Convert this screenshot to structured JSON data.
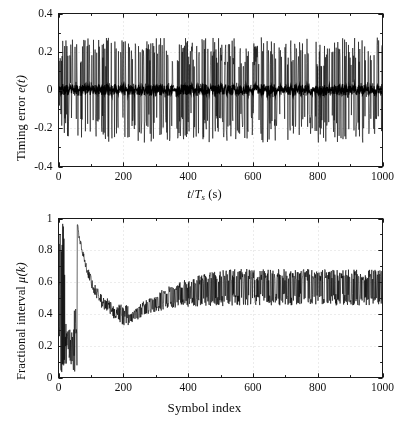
{
  "figure": {
    "background_color": "#ffffff",
    "line_color": "#000000",
    "axis_color": "#1a1a1a",
    "grid_color": "#c8c8c8"
  },
  "chart_data": [
    {
      "id": "timing-error-plot",
      "type": "line",
      "title": "",
      "xlabel": "t/Ts (s)",
      "xlabel_parts": {
        "num": "t",
        "den": "T",
        "den_sub": "s",
        "unit": "(s)"
      },
      "ylabel": "Timing error e(t)",
      "ylabel_parts": {
        "text": "Timing error ",
        "sym": "e",
        "arg": "(t)"
      },
      "xlim": [
        0,
        1000
      ],
      "ylim": [
        -0.4,
        0.4
      ],
      "xticks": [
        0,
        200,
        400,
        600,
        800,
        1000
      ],
      "xticklabels": [
        "0",
        "200",
        "400",
        "600",
        "800",
        "1000"
      ],
      "yticks": [
        -0.4,
        -0.2,
        0,
        0.2,
        0.4
      ],
      "yticklabels": [
        "-0.4",
        "-0.2",
        "0",
        "0.2",
        "0.4"
      ],
      "grid": true,
      "grid_style": "dotted",
      "series_description": "zero-mean timing error jitter",
      "noise_envelope": 0.255,
      "noise_core": 0.035,
      "n_points": 1000,
      "seed": 20240117
    },
    {
      "id": "fractional-interval-plot",
      "type": "line",
      "title": "",
      "xlabel": "Symbol index",
      "ylabel": "Fractional interval μ(k)",
      "ylabel_parts": {
        "text": "Fractional interval ",
        "sym": "μ",
        "arg": "(k)"
      },
      "xlim": [
        0,
        1000
      ],
      "ylim": [
        0,
        1
      ],
      "xticks": [
        0,
        200,
        400,
        600,
        800,
        1000
      ],
      "xticklabels": [
        "0",
        "200",
        "400",
        "600",
        "800",
        "1000"
      ],
      "yticks": [
        0,
        0.2,
        0.4,
        0.6,
        0.8,
        1
      ],
      "yticklabels": [
        "0",
        "0.2",
        "0.4",
        "0.6",
        "0.8",
        "1"
      ],
      "grid": true,
      "grid_style": "dotted",
      "series_description": "fractional interval with initial wrap transient then convergence",
      "transient_end": 58,
      "peak_value": 0.96,
      "min_value": 0.36,
      "min_index": 215,
      "steady_value": 0.585,
      "steady_spread": 0.115,
      "n_points": 1000,
      "seed": 99173
    }
  ]
}
